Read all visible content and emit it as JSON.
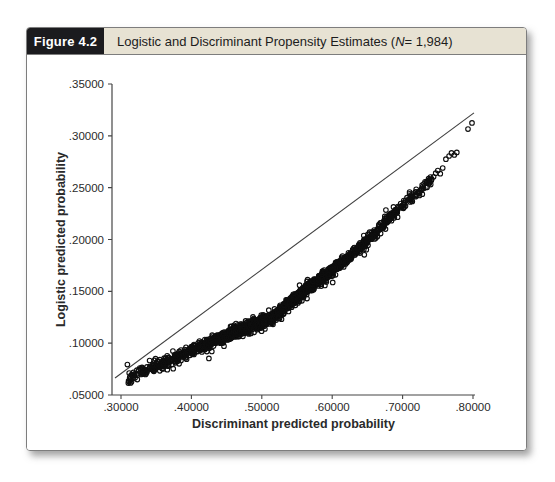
{
  "figure": {
    "label": "Figure 4.2",
    "title_prefix": "Logistic and Discriminant Propensity Estimates (",
    "title_n": "N",
    "title_suffix": " = 1,984)"
  },
  "colors": {
    "page_bg": "#ffffff",
    "figure_label_bg": "#1b1b1e",
    "figure_label_text": "#ffffff",
    "header_bg": "#e7e2d3",
    "header_text": "#1c1c1c",
    "frame_border": "#7d7d7d",
    "axis": "#454545",
    "tick_text": "#2a2a2a",
    "marker": "#0e0e0e",
    "reference_line": "#3f3f3f"
  },
  "chart_data": {
    "type": "scatter",
    "title": "Logistic and Discriminant Propensity Estimates (N = 1,984)",
    "xlabel": "Discriminant predicted probability",
    "ylabel": "Logistic predicted probability",
    "n_points_labeled": 1984,
    "grid": false,
    "legend": "none",
    "xlim": [
      0.287,
      0.803
    ],
    "ylim": [
      0.05,
      0.35
    ],
    "x_ticks": [
      {
        "value": 0.3,
        "label": ".30000"
      },
      {
        "value": 0.4,
        "label": ".40000"
      },
      {
        "value": 0.5,
        "label": ".50000"
      },
      {
        "value": 0.6,
        "label": ".60000"
      },
      {
        "value": 0.7,
        "label": ".70000"
      },
      {
        "value": 0.8,
        "label": ".80000"
      }
    ],
    "y_ticks": [
      {
        "value": 0.05,
        "label": ".05000"
      },
      {
        "value": 0.1,
        "label": ".10000"
      },
      {
        "value": 0.15,
        "label": ".15000"
      },
      {
        "value": 0.2,
        "label": ".20000"
      },
      {
        "value": 0.25,
        "label": ".25000"
      },
      {
        "value": 0.3,
        "label": ".30000"
      },
      {
        "value": 0.35,
        "label": ".35000"
      }
    ],
    "marker": {
      "shape": "open-circle",
      "radius": 2.3,
      "stroke_width": 1.1
    },
    "reference_line": {
      "x1": 0.2915,
      "y1": 0.0664,
      "x2": 0.8014,
      "y2": 0.3221,
      "width": 1.1
    },
    "scatter_model": {
      "seed": 1984,
      "n_generated": 1972,
      "x_range": [
        0.308,
        0.742
      ],
      "x_mean": 0.52,
      "x_sigma": 0.085,
      "x_uniform_frac": 0.22,
      "curve_anchors": [
        [
          0.304,
          0.065
        ],
        [
          0.35,
          0.0775
        ],
        [
          0.399,
          0.0925
        ],
        [
          0.456,
          0.109
        ],
        [
          0.513,
          0.1233
        ],
        [
          0.556,
          0.1484
        ],
        [
          0.6125,
          0.1764
        ],
        [
          0.65,
          0.199
        ],
        [
          0.6906,
          0.2276
        ],
        [
          0.715,
          0.2425
        ],
        [
          0.744,
          0.259
        ]
      ],
      "y_sigma": 0.0026,
      "outlier_frac": 0.05,
      "outlier_mult": 2.2,
      "tail_points": [
        [
          0.744,
          0.2605
        ],
        [
          0.747,
          0.264
        ],
        [
          0.75,
          0.2665
        ],
        [
          0.7535,
          0.2635
        ],
        [
          0.757,
          0.269
        ],
        [
          0.7615,
          0.2775
        ],
        [
          0.766,
          0.2805
        ],
        [
          0.7695,
          0.2835
        ],
        [
          0.7735,
          0.2815
        ],
        [
          0.777,
          0.284
        ],
        [
          0.7929,
          0.3065
        ],
        [
          0.7986,
          0.3125
        ]
      ]
    }
  }
}
